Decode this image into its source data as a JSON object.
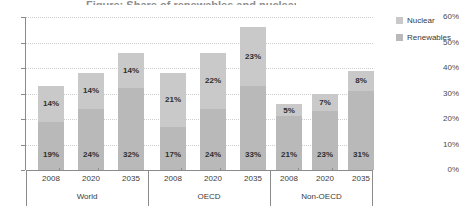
{
  "title_sliver": "Figure: Share of renewables and nuclear in electricity generation",
  "legend": {
    "position": "right",
    "items": [
      {
        "label": "Nuclear",
        "color": "#c9c9c9",
        "icon": "legend-swatch-icon"
      },
      {
        "label": "Renewables",
        "color": "#b9b9b9",
        "icon": "legend-swatch-icon"
      }
    ]
  },
  "axes": {
    "y_ticks": [
      "0%",
      "10%",
      "20%",
      "30%",
      "40%",
      "50%",
      "60%"
    ],
    "y_min": 0,
    "y_max": 60,
    "y_label": "",
    "x_label": ""
  },
  "chart_data": {
    "type": "bar",
    "stacked": true,
    "title": "",
    "xlabel": "",
    "ylabel": "",
    "ylim": [
      0,
      60
    ],
    "ytick_values": [
      0,
      10,
      20,
      30,
      40,
      50,
      60
    ],
    "ytick_labels": [
      "0%",
      "10%",
      "20%",
      "30%",
      "40%",
      "50%",
      "60%"
    ],
    "grid": true,
    "legend_position": "right",
    "groups": [
      "World",
      "OECD",
      "Non-OECD"
    ],
    "categories": [
      "2008",
      "2020",
      "2035",
      "2008",
      "2020",
      "2035",
      "2008",
      "2020",
      "2035"
    ],
    "series": [
      {
        "name": "Renewables",
        "color": "#b9b9b9",
        "values": [
          19,
          24,
          32,
          17,
          24,
          33,
          21,
          23,
          31
        ],
        "labels": [
          "19%",
          "24%",
          "32%",
          "17%",
          "24%",
          "33%",
          "21%",
          "23%",
          "31%"
        ]
      },
      {
        "name": "Nuclear",
        "color": "#c9c9c9",
        "values": [
          14,
          14,
          14,
          21,
          22,
          23,
          5,
          7,
          8
        ],
        "labels": [
          "14%",
          "14%",
          "14%",
          "21%",
          "22%",
          "23%",
          "5%",
          "7%",
          "8%"
        ]
      }
    ],
    "totals": [
      33,
      38,
      46,
      38,
      46,
      56,
      26,
      30,
      39
    ],
    "bars": [
      {
        "group": "World",
        "year": "2008",
        "renewables": 19,
        "nuclear": 14,
        "total": 33
      },
      {
        "group": "World",
        "year": "2020",
        "renewables": 24,
        "nuclear": 14,
        "total": 38
      },
      {
        "group": "World",
        "year": "2035",
        "renewables": 32,
        "nuclear": 14,
        "total": 46
      },
      {
        "group": "OECD",
        "year": "2008",
        "renewables": 17,
        "nuclear": 21,
        "total": 38
      },
      {
        "group": "OECD",
        "year": "2020",
        "renewables": 24,
        "nuclear": 22,
        "total": 46
      },
      {
        "group": "OECD",
        "year": "2035",
        "renewables": 33,
        "nuclear": 23,
        "total": 56
      },
      {
        "group": "Non-OECD",
        "year": "2008",
        "renewables": 21,
        "nuclear": 5,
        "total": 26
      },
      {
        "group": "Non-OECD",
        "year": "2020",
        "renewables": 23,
        "nuclear": 7,
        "total": 30
      },
      {
        "group": "Non-OECD",
        "year": "2035",
        "renewables": 31,
        "nuclear": 8,
        "total": 39
      }
    ]
  }
}
